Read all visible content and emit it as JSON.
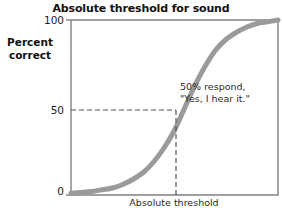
{
  "chart_data": {
    "type": "line",
    "title": "Absolute threshold for sound",
    "xlabel": "Absolute threshold",
    "ylabel_lines": [
      "Percent",
      "correct"
    ],
    "ylabel": "Percent correct",
    "ylim": [
      0,
      100
    ],
    "yticks": [
      0,
      50,
      100
    ],
    "ytick_labels": [
      "0",
      "50",
      "100"
    ],
    "xticks": [],
    "xtick_labels": [],
    "grid": false,
    "legend": null,
    "series": [
      {
        "name": "Psychometric function",
        "color": "#9a9a9a",
        "x": [
          0,
          5,
          10,
          15,
          20,
          25,
          30,
          35,
          40,
          45,
          50,
          55,
          60,
          65,
          70,
          75,
          80,
          85,
          90,
          95,
          100
        ],
        "y": [
          1,
          1.5,
          2,
          3,
          4,
          6,
          9,
          13,
          19,
          27,
          37,
          50,
          63,
          74,
          83,
          89,
          93,
          96,
          98,
          99,
          100
        ]
      }
    ],
    "annotations": [
      {
        "name": "threshold-callout",
        "lines": [
          "50% respond,",
          "\"Yes, I hear it.\""
        ],
        "at_x": 55,
        "at_y": 50
      },
      {
        "name": "threshold-guides",
        "horizontal_at_y": 50,
        "vertical_at_x": 55,
        "style": "dashed"
      }
    ]
  },
  "chart": {
    "title": "Absolute threshold for sound",
    "xlabel": "Absolute threshold",
    "ylabel_line1": "Percent",
    "ylabel_line2": "correct",
    "tick_100": "100",
    "tick_50": "50",
    "tick_0": "0",
    "annotation_line1": "50% respond,",
    "annotation_line2": "\"Yes, I hear it.\"",
    "colors": {
      "curve": "#9a9a9a",
      "axis": "#6b6b6b",
      "guide": "#6b6b6b",
      "text": "#1a1a1a",
      "background": "#ffffff"
    }
  }
}
